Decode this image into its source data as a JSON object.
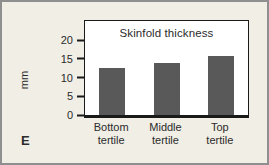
{
  "panel": {
    "label": "E"
  },
  "chart_data": {
    "type": "bar",
    "title": "Skinfold thickness",
    "xlabel": "",
    "ylabel": "mm",
    "categories": [
      "Bottom\ntertile",
      "Middle\ntertile",
      "Top\ntertile"
    ],
    "values": [
      12.5,
      14,
      15.8
    ],
    "yticks": [
      0,
      5,
      10,
      15,
      20
    ],
    "ylim": [
      0,
      20
    ],
    "grid": false,
    "legend": false,
    "colors": {
      "bar": "#595959",
      "panel_background": "#f0eee5",
      "plot_background": "#ffffff",
      "axis": "#1a1a1a",
      "frame_border": "#8f8f8f",
      "text": "#2b2b2b"
    }
  }
}
